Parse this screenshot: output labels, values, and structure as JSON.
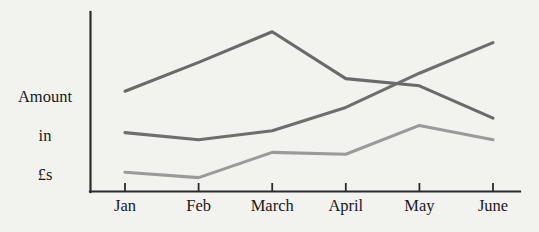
{
  "chart_data": {
    "type": "line",
    "title": "",
    "xlabel": "",
    "ylabel": "Amount in £s",
    "categories": [
      "Jan",
      "Feb",
      "March",
      "April",
      "May",
      "June"
    ],
    "ylim": [
      0,
      100
    ],
    "xlim": [
      0,
      5
    ],
    "grid": false,
    "legend": "none",
    "axis_color": "#2b2b2b",
    "background_color": "#f2f2ef",
    "series": [
      {
        "name": "Series 1",
        "color": "#6a6a6a",
        "values": [
          56,
          72,
          89,
          63,
          59,
          41
        ]
      },
      {
        "name": "Series 2",
        "color": "#6e6e6e",
        "values": [
          33,
          29,
          34,
          47,
          66,
          83
        ]
      },
      {
        "name": "Series 3",
        "color": "#9a9a9a",
        "values": [
          11,
          8,
          22,
          21,
          37,
          29
        ]
      }
    ]
  },
  "y_axis": {
    "label_line1": "Amount",
    "label_line2": "in",
    "label_line3": "£s"
  },
  "x_axis": {
    "labels": [
      "Jan",
      "Feb",
      "March",
      "April",
      "May",
      "June"
    ]
  }
}
